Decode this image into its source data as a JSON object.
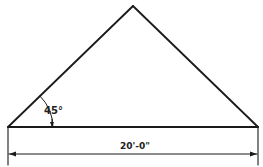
{
  "diagram": {
    "type": "roof-section-drawing",
    "angle_label": "45°",
    "span_label": "20'-0\"",
    "line_color": "#1a1a1a"
  }
}
